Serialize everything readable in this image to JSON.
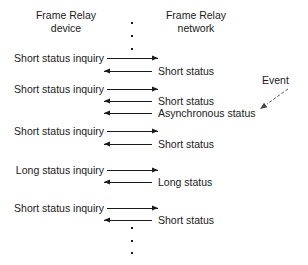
{
  "diagram": {
    "width": 308,
    "height": 265,
    "line_color": "#1a1a1a",
    "background": "#ffffff"
  },
  "headers": {
    "left": {
      "line1": "Frame Relay",
      "line2": "device"
    },
    "right": {
      "line1": "Frame Relay",
      "line2": "network"
    }
  },
  "annotation": {
    "event_label": "Event"
  },
  "dots": {
    "top": [
      {
        "x": 131,
        "y": 22
      },
      {
        "x": 131,
        "y": 35
      },
      {
        "x": 131,
        "y": 48
      }
    ],
    "bottom": [
      {
        "x": 131,
        "y": 227
      },
      {
        "x": 131,
        "y": 240
      },
      {
        "x": 131,
        "y": 252
      }
    ]
  },
  "messages": [
    {
      "id": "m1",
      "label": "Short status inquiry",
      "direction": "right",
      "side": "left",
      "y": 58,
      "x1": 107,
      "x2": 158,
      "label_x": 14,
      "label_y": 52
    },
    {
      "id": "m2",
      "label": "Short status",
      "direction": "left",
      "side": "right",
      "y": 71,
      "x1": 104,
      "x2": 152,
      "label_x": 158,
      "label_y": 65
    },
    {
      "id": "m3",
      "label": "Short status inquiry",
      "direction": "right",
      "side": "left",
      "y": 89,
      "x1": 107,
      "x2": 158,
      "label_x": 14,
      "label_y": 83
    },
    {
      "id": "m4",
      "label": "Short status",
      "direction": "left",
      "side": "right",
      "y": 101,
      "x1": 104,
      "x2": 152,
      "label_x": 158,
      "label_y": 95
    },
    {
      "id": "m5",
      "label": "Asynchronous status",
      "direction": "left",
      "side": "right",
      "y": 113,
      "x1": 104,
      "x2": 152,
      "label_x": 158,
      "label_y": 107
    },
    {
      "id": "m6",
      "label": "Short status inquiry",
      "direction": "right",
      "side": "left",
      "y": 131,
      "x1": 107,
      "x2": 158,
      "label_x": 14,
      "label_y": 125
    },
    {
      "id": "m7",
      "label": "Short status",
      "direction": "left",
      "side": "right",
      "y": 144,
      "x1": 104,
      "x2": 152,
      "label_x": 158,
      "label_y": 138
    },
    {
      "id": "m8",
      "label": "Long status inquiry",
      "direction": "right",
      "side": "left",
      "y": 170,
      "x1": 107,
      "x2": 158,
      "label_x": 14,
      "label_y": 164
    },
    {
      "id": "m9",
      "label": "Long status",
      "direction": "left",
      "side": "right",
      "y": 182,
      "x1": 104,
      "x2": 152,
      "label_x": 158,
      "label_y": 176
    },
    {
      "id": "m10",
      "label": "Short status inquiry",
      "direction": "right",
      "side": "left",
      "y": 208,
      "x1": 107,
      "x2": 158,
      "label_x": 14,
      "label_y": 202
    },
    {
      "id": "m11",
      "label": "Short status",
      "direction": "left",
      "side": "right",
      "y": 220,
      "x1": 104,
      "x2": 152,
      "label_x": 158,
      "label_y": 214
    }
  ],
  "event_pointer": {
    "x1": 288,
    "y1": 89,
    "x2": 260,
    "y2": 109
  }
}
